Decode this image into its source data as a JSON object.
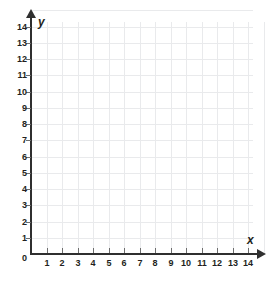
{
  "figure": {
    "kind": "coordinate-grid",
    "title": "",
    "background_color": "#ffffff",
    "grid_color": "#e9eaec",
    "axis_color": "#2f2f2f",
    "tick_color": "#6d6d6d",
    "label_color": "#231f20"
  },
  "axes": {
    "x": {
      "name": "x",
      "min": 0,
      "max": 14,
      "step": 1,
      "tick_labels": [
        "1",
        "2",
        "3",
        "4",
        "5",
        "6",
        "7",
        "8",
        "9",
        "10",
        "11",
        "12",
        "13",
        "14"
      ],
      "origin_label": "0",
      "arrow": "right-arrow-icon"
    },
    "y": {
      "name": "y",
      "min": 0,
      "max": 14,
      "step": 1,
      "tick_labels": [
        "1",
        "2",
        "3",
        "4",
        "5",
        "6",
        "7",
        "8",
        "9",
        "10",
        "11",
        "12",
        "13",
        "14"
      ],
      "arrow": "up-arrow-icon"
    }
  },
  "chart_data": {
    "type": "scatter",
    "title": "",
    "xlabel": "x",
    "ylabel": "y",
    "xlim": [
      0,
      14
    ],
    "ylim": [
      0,
      14
    ],
    "xticks": [
      0,
      1,
      2,
      3,
      4,
      5,
      6,
      7,
      8,
      9,
      10,
      11,
      12,
      13,
      14
    ],
    "yticks": [
      0,
      1,
      2,
      3,
      4,
      5,
      6,
      7,
      8,
      9,
      10,
      11,
      12,
      13,
      14
    ],
    "xticklabels": [
      "0",
      "1",
      "2",
      "3",
      "4",
      "5",
      "6",
      "7",
      "8",
      "9",
      "10",
      "11",
      "12",
      "13",
      "14"
    ],
    "yticklabels": [
      "0",
      "1",
      "2",
      "3",
      "4",
      "5",
      "6",
      "7",
      "8",
      "9",
      "10",
      "11",
      "12",
      "13",
      "14"
    ],
    "grid": true,
    "legend": null,
    "series": [],
    "annotations": [],
    "note": "Empty first-quadrant coordinate plane; no data points plotted."
  }
}
